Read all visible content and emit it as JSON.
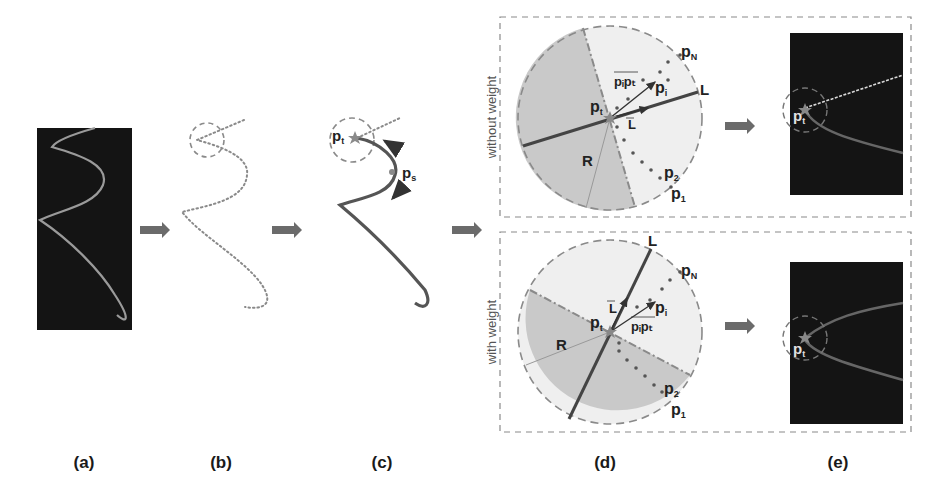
{
  "figure": {
    "panels": [
      {
        "id": "a",
        "label": "(a)"
      },
      {
        "id": "b",
        "label": "(b)"
      },
      {
        "id": "c",
        "label": "(c)"
      },
      {
        "id": "d",
        "label": "(d)"
      },
      {
        "id": "e",
        "label": "(e)"
      }
    ],
    "c_labels": {
      "pt": "p",
      "pt_sub": "t",
      "ps": "p",
      "ps_sub": "s"
    },
    "d_top": {
      "side_label": "without weight",
      "line_label": "L",
      "vector_L": "L",
      "vector_pipt": "pᵢpₜ",
      "R": "R",
      "pt": "p",
      "pt_sub": "t",
      "pi": "p",
      "pi_sub": "i",
      "pN": "p",
      "pN_sub": "N",
      "p2": "p",
      "p2_sub": "2",
      "p1": "p",
      "p1_sub": "1"
    },
    "d_bottom": {
      "side_label": "with weight",
      "line_label": "L",
      "vector_L": "L",
      "vector_pipt": "pᵢpₜ",
      "R": "R",
      "pt": "p",
      "pt_sub": "t",
      "pi": "p",
      "pi_sub": "i",
      "pN": "p",
      "pN_sub": "N",
      "p2": "p",
      "p2_sub": "2",
      "p1": "p",
      "p1_sub": "1"
    },
    "e_labels": {
      "top_pt": "p",
      "top_pt_sub": "t",
      "bottom_pt": "p",
      "bottom_pt_sub": "t"
    },
    "colors": {
      "dark_bg": "#141414",
      "curve_light": "#9a9a9a",
      "curve_dark": "#555555",
      "arrow": "#6b6b6b",
      "shade_dark": "#c9c9c9",
      "shade_light": "#efefef",
      "dash": "#8a8a8a"
    }
  }
}
